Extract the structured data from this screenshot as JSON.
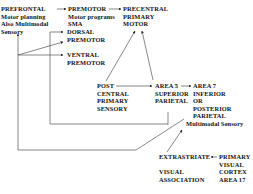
{
  "diagram": {
    "type": "flow",
    "nodes": [
      {
        "id": "prefrontal",
        "lines": [
          "PREFRONTAL",
          "Motor planning",
          "Also Multimodal",
          "Sensory"
        ]
      },
      {
        "id": "premotor",
        "lines": [
          "PREMOTOR",
          "Motor programs",
          "SMA"
        ]
      },
      {
        "id": "dorsal_premotor",
        "lines": [
          "DORSAL",
          "PREMOTOR"
        ]
      },
      {
        "id": "ventral_premotor",
        "lines": [
          "VENTRAL",
          "PREMOTOR"
        ]
      },
      {
        "id": "precentral",
        "lines": [
          "PRECENTRAL",
          "PRIMARY",
          "MOTOR"
        ]
      },
      {
        "id": "postcentral",
        "lines": [
          "POST",
          "CENTRAL",
          "PRIMARY",
          "SENSORY"
        ]
      },
      {
        "id": "area5",
        "lines": [
          "AREA 5",
          "SUPERIOR",
          "PARIETAL"
        ]
      },
      {
        "id": "area7",
        "lines": [
          "AREA 7",
          "INFERIOR",
          "OR",
          "POSTERIOR",
          "PARIETAL",
          "Multimodal Sensory"
        ]
      },
      {
        "id": "extrastriate",
        "lines": [
          "EXTRASTRIATE",
          "",
          "VISUAL",
          "ASSOCIATION"
        ]
      },
      {
        "id": "primary_visual",
        "lines": [
          "PRIMARY",
          "VISUAL",
          "CORTEX",
          "AREA 17"
        ]
      }
    ],
    "edges": [
      {
        "from": "prefrontal",
        "to": "premotor"
      },
      {
        "from": "premotor",
        "to": "precentral"
      },
      {
        "from": "prefrontal",
        "to": "dorsal_premotor"
      },
      {
        "from": "prefrontal",
        "to": "ventral_premotor"
      },
      {
        "from": "postcentral",
        "to": "precentral"
      },
      {
        "from": "area5",
        "to": "precentral"
      },
      {
        "from": "postcentral",
        "to": "area5"
      },
      {
        "from": "area5",
        "to": "area7"
      },
      {
        "from": "area5",
        "to": "dorsal_premotor"
      },
      {
        "from": "primary_visual",
        "to": "extrastriate"
      },
      {
        "from": "extrastriate",
        "to": "area7"
      },
      {
        "from": "area7",
        "to": "prefrontal"
      }
    ]
  }
}
